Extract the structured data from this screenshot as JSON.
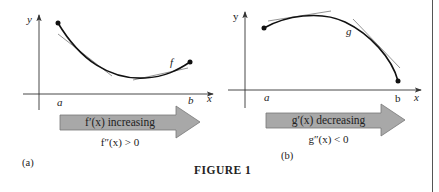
{
  "figure": {
    "caption": "FIGURE 1",
    "panels": [
      {
        "id": "a",
        "panel_label": "(a)",
        "function_label": "f",
        "axis_x_label": "x",
        "axis_y_label": "y",
        "interval_start_label": "a",
        "interval_end_label": "b",
        "arrow_text": "f′(x) increasing",
        "condition": "f″(x) > 0",
        "curve_shape": "concave up"
      },
      {
        "id": "b",
        "panel_label": "(b)",
        "function_label": "g",
        "axis_x_label": "x",
        "axis_y_label": "y",
        "interval_start_label": "a",
        "interval_end_label": "b",
        "arrow_text": "g′(x) decreasing",
        "condition": "g″(x) < 0",
        "curve_shape": "concave down"
      }
    ],
    "colors": {
      "arrow_fill": "#a8a8a8",
      "arrow_stroke": "#777777",
      "curve": "#111111",
      "tangent": "#888888",
      "axis": "#333333"
    }
  }
}
